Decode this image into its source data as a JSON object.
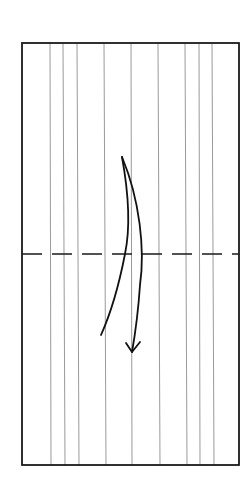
{
  "diagram": {
    "type": "origami-fold-step",
    "colors": {
      "background": "#ffffff",
      "frame": "#1a1a1a",
      "crease": "#9a9a9a",
      "fold_line": "#1a1a1a",
      "arrow": "#111111"
    },
    "paper": {
      "x": 22,
      "y": 43,
      "width": 217,
      "height": 422
    },
    "creases_top_x": [
      50,
      63,
      77,
      104,
      131,
      158,
      185,
      199,
      212
    ],
    "creases_bottom_x": [
      51,
      65,
      79,
      106,
      132,
      160,
      187,
      200,
      214
    ],
    "valley_fold_line": {
      "y": 254,
      "dash": "20 10"
    },
    "arrow": {
      "direction": "down",
      "meaning": "fold top half down along dashed line",
      "back_path": "M122,157 C128,190 131,225 125,254 C118,290 110,315 101,335",
      "front_path": "M122,157 C140,200 145,250 140,285 C138,315 135,335 132,352",
      "head": "M126,343 L132,352 L140,342"
    }
  }
}
